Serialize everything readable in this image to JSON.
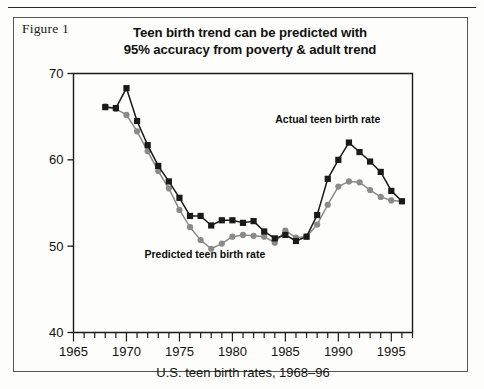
{
  "figure": {
    "caption": "Figure 1"
  },
  "chart_data": {
    "type": "line",
    "title": "Teen birth trend can be predicted with 95% accuracy from poverty & adult trend",
    "title_line1": "Teen birth trend can be predicted with",
    "title_line2": "95% accuracy from poverty & adult trend",
    "xlabel": "U.S. teen birth rates, 1968–96",
    "ylabel": "",
    "xlim": [
      1965,
      1997
    ],
    "ylim": [
      40,
      70
    ],
    "grid": false,
    "legend_position": "inline-annotations",
    "x_tick_labels": [
      "1965",
      "1970",
      "1975",
      "1980",
      "1985",
      "1990",
      "1995"
    ],
    "x_major_ticks": [
      1965,
      1970,
      1975,
      1980,
      1985,
      1990,
      1995
    ],
    "x_minor_tick_step": 1,
    "y_tick_labels": [
      "40",
      "50",
      "60",
      "70"
    ],
    "y_major_ticks": [
      40,
      50,
      60,
      70
    ],
    "x": [
      1968,
      1969,
      1970,
      1971,
      1972,
      1973,
      1974,
      1975,
      1976,
      1977,
      1978,
      1979,
      1980,
      1981,
      1982,
      1983,
      1984,
      1985,
      1986,
      1987,
      1988,
      1989,
      1990,
      1991,
      1992,
      1993,
      1994,
      1995,
      1996
    ],
    "series": [
      {
        "name": "Actual teen birth rate",
        "color": "#1a1a1a",
        "marker": "square",
        "values": [
          66.1,
          66.0,
          68.3,
          64.5,
          61.7,
          59.3,
          57.5,
          55.6,
          53.5,
          53.5,
          52.4,
          53.0,
          53.0,
          52.7,
          52.9,
          51.7,
          50.9,
          51.3,
          50.6,
          51.1,
          53.6,
          57.8,
          60.0,
          62.0,
          60.9,
          59.8,
          58.6,
          56.4,
          55.2
        ]
      },
      {
        "name": "Predicted teen birth rate",
        "color": "#8a8a8a",
        "marker": "circle",
        "values": [
          66.2,
          65.9,
          65.2,
          63.3,
          61.0,
          58.7,
          56.7,
          54.2,
          52.2,
          50.7,
          49.7,
          50.3,
          51.1,
          51.3,
          51.2,
          51.1,
          50.4,
          51.8,
          51.0,
          51.1,
          52.5,
          54.8,
          56.9,
          57.5,
          57.4,
          56.5,
          55.7,
          55.3,
          55.2
        ]
      }
    ],
    "annotations": [
      {
        "text": "Actual teen birth rate",
        "x": 1989.0,
        "y": 64.3,
        "anchor": "middle"
      },
      {
        "text": "Predicted teen birth rate",
        "x": 1977.4,
        "y": 48.6,
        "anchor": "middle"
      }
    ]
  }
}
